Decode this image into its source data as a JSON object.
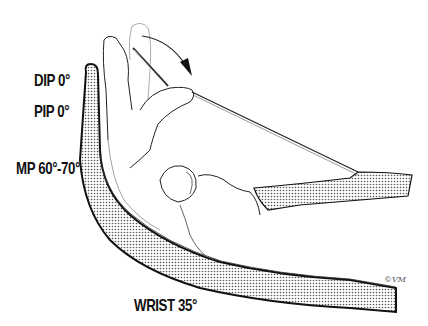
{
  "figure": {
    "labels": {
      "dip": "DIP 0°",
      "pip": "PIP 0°",
      "mp": "MP 60°-70°",
      "wrist": "WRIST 35°"
    },
    "signature": "©VM",
    "colors": {
      "ink": "#111111",
      "stipple": "#6b6b6b",
      "background": "#ffffff"
    }
  }
}
